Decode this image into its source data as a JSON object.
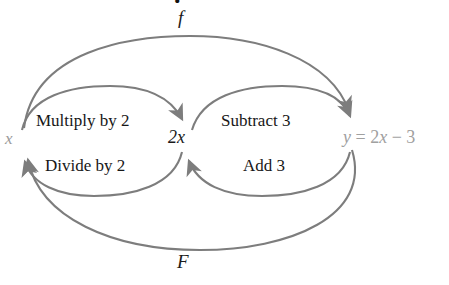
{
  "figure": {
    "type": "function-mapping-diagram",
    "width": 449,
    "height": 285,
    "background": "#ffffff",
    "stroke_color": "#7d7d7d",
    "text_color": "#171717",
    "muted_text_color": "#9c9c9c"
  },
  "nodes": {
    "left": "x",
    "middle": "2x",
    "right_y": "y",
    "right_eq": " = 2",
    "right_var": "x",
    "right_tail": " − 3",
    "right_full": "y = 2x − 3"
  },
  "operations": {
    "forward_first": "Multiply by 2",
    "forward_second": "Subtract 3",
    "inverse_first": "Divide by 2",
    "inverse_second": "Add 3"
  },
  "arcs": {
    "outer_top_label": "f",
    "outer_bottom_label": "F"
  },
  "clipped_top_glyph": "."
}
